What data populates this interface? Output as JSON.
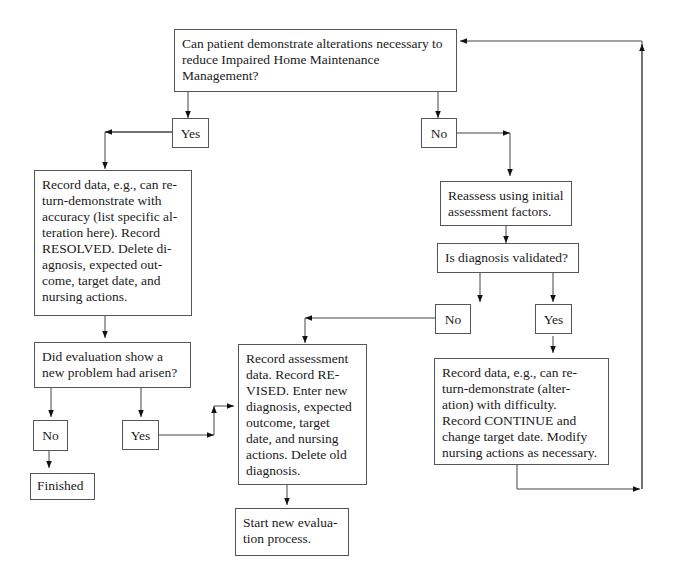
{
  "diagram": {
    "type": "flowchart",
    "nodes": {
      "start_question": "Can patient demonstrate alterations necessary to\nreduce Impaired Home Maintenance\nManagement?",
      "yes_1": "Yes",
      "no_1": "No",
      "record_resolved": "Record data, e.g., can re-\nturn-demonstrate with\naccuracy (list specific al-\nteration here). Record\nRESOLVED. Delete di-\nagnosis, expected out-\ncome, target date, and\nnursing actions.",
      "reassess": "Reassess using initial\nassessment factors.",
      "diagnosis_validated": "Is diagnosis validated?",
      "no_2": "No",
      "yes_2": "Yes",
      "new_problem_question": "Did evaluation show a\nnew problem had arisen?",
      "no_3": "No",
      "yes_3": "Yes",
      "finished": "Finished",
      "record_revised": "Record assessment\ndata. Record RE-\nVISED. Enter new\ndiagnosis, expected\noutcome, target\ndate, and nursing\nactions. Delete old\ndiagnosis.",
      "record_continue": "Record data, e.g., can re-\nturn-demonstrate (alter-\nation) with difficulty.\nRecord CONTINUE and\nchange target date. Modify\nnursing actions as necessary.",
      "start_new_evaluation": "Start new evalua-\ntion process."
    },
    "edges": [
      {
        "from": "start_question",
        "to": "yes_1"
      },
      {
        "from": "start_question",
        "to": "no_1"
      },
      {
        "from": "yes_1",
        "to": "record_resolved"
      },
      {
        "from": "no_1",
        "to": "reassess"
      },
      {
        "from": "reassess",
        "to": "diagnosis_validated"
      },
      {
        "from": "diagnosis_validated",
        "to": "no_2"
      },
      {
        "from": "diagnosis_validated",
        "to": "yes_2"
      },
      {
        "from": "record_resolved",
        "to": "new_problem_question"
      },
      {
        "from": "new_problem_question",
        "to": "no_3"
      },
      {
        "from": "new_problem_question",
        "to": "yes_3"
      },
      {
        "from": "no_3",
        "to": "finished"
      },
      {
        "from": "yes_3",
        "to": "record_revised"
      },
      {
        "from": "no_2",
        "to": "record_revised"
      },
      {
        "from": "yes_2",
        "to": "record_continue"
      },
      {
        "from": "record_revised",
        "to": "start_new_evaluation"
      },
      {
        "from": "record_continue",
        "to": "start_question"
      }
    ]
  }
}
